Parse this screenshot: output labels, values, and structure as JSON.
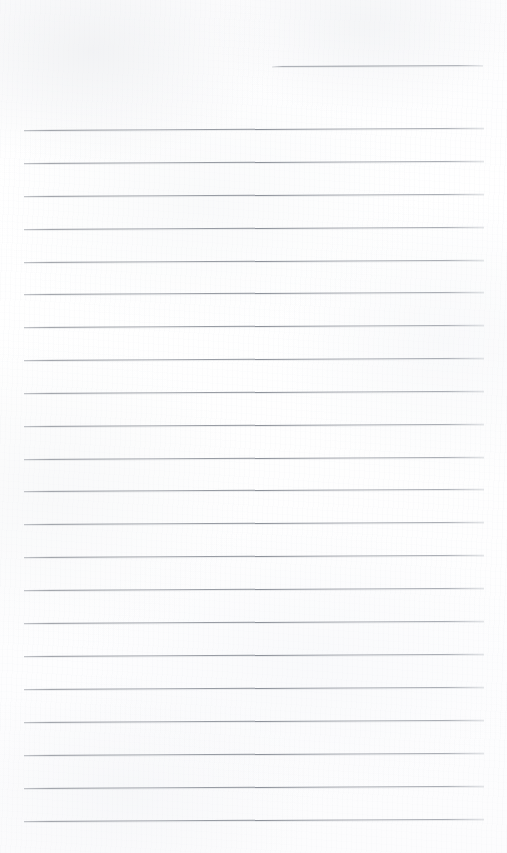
{
  "document": {
    "kind": "scanned-ruled-notebook-page",
    "title": "Blank Ruled Page",
    "page_width": 507,
    "page_height": 853,
    "background_color": "#fdfdfd",
    "rule_color": "#8b9099",
    "has_text": false,
    "text_content": "",
    "margin_rule_visible": false
  },
  "ruling": {
    "line_count": 23,
    "full_width_line_count": 22,
    "partial_line_count": 1,
    "left_margin_x": 24,
    "right_margin_x": 484,
    "line_spacing": 32.9,
    "first_full_line_y": 130,
    "last_line_y": 821,
    "tilt_degrees": -0.28,
    "lines": [
      {
        "index": 0,
        "x": 272,
        "y": 66,
        "width": 211,
        "partial": true
      },
      {
        "index": 1,
        "x": 24,
        "y": 130,
        "width": 460,
        "partial": false
      },
      {
        "index": 2,
        "x": 24,
        "y": 163,
        "width": 460,
        "partial": false
      },
      {
        "index": 3,
        "x": 24,
        "y": 196,
        "width": 460,
        "partial": false
      },
      {
        "index": 4,
        "x": 24,
        "y": 229,
        "width": 460,
        "partial": false
      },
      {
        "index": 5,
        "x": 24,
        "y": 262,
        "width": 460,
        "partial": false
      },
      {
        "index": 6,
        "x": 24,
        "y": 294,
        "width": 460,
        "partial": false
      },
      {
        "index": 7,
        "x": 24,
        "y": 327,
        "width": 460,
        "partial": false
      },
      {
        "index": 8,
        "x": 24,
        "y": 360,
        "width": 460,
        "partial": false
      },
      {
        "index": 9,
        "x": 24,
        "y": 393,
        "width": 460,
        "partial": false
      },
      {
        "index": 10,
        "x": 24,
        "y": 426,
        "width": 460,
        "partial": false
      },
      {
        "index": 11,
        "x": 24,
        "y": 459,
        "width": 460,
        "partial": false
      },
      {
        "index": 12,
        "x": 24,
        "y": 491,
        "width": 460,
        "partial": false
      },
      {
        "index": 13,
        "x": 24,
        "y": 524,
        "width": 460,
        "partial": false
      },
      {
        "index": 14,
        "x": 24,
        "y": 557,
        "width": 460,
        "partial": false
      },
      {
        "index": 15,
        "x": 24,
        "y": 590,
        "width": 460,
        "partial": false
      },
      {
        "index": 16,
        "x": 24,
        "y": 623,
        "width": 460,
        "partial": false
      },
      {
        "index": 17,
        "x": 24,
        "y": 656,
        "width": 460,
        "partial": false
      },
      {
        "index": 18,
        "x": 24,
        "y": 689,
        "width": 460,
        "partial": false
      },
      {
        "index": 19,
        "x": 24,
        "y": 722,
        "width": 460,
        "partial": false
      },
      {
        "index": 20,
        "x": 24,
        "y": 755,
        "width": 460,
        "partial": false
      },
      {
        "index": 21,
        "x": 24,
        "y": 788,
        "width": 460,
        "partial": false
      },
      {
        "index": 22,
        "x": 24,
        "y": 821,
        "width": 460,
        "partial": false
      }
    ]
  }
}
